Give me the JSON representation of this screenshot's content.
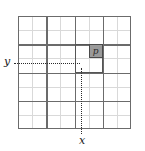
{
  "figure": {
    "type": "grid-diagram",
    "width": 145,
    "height": 151
  },
  "grid": {
    "columns": 8,
    "rows": 8,
    "block_size": 2,
    "left": 18,
    "top": 16,
    "width": 113,
    "height": 113,
    "cell_size": 14.125,
    "minor_line_color": "#d9d9d9",
    "major_line_color": "#6b6b6b",
    "minor_positions": [
      1,
      3,
      5,
      7
    ],
    "major_positions": [
      0,
      2,
      4,
      6,
      8
    ]
  },
  "highlight_block": {
    "label": "highlighted-block",
    "col": 4,
    "row": 2,
    "span_cols": 2,
    "span_rows": 2,
    "border_color": "#555555"
  },
  "shaded_cell": {
    "label": "p",
    "col": 5,
    "row": 2,
    "fill_color": "#9a9a9a",
    "border_color": "#4a4a4a"
  },
  "guides": {
    "horizontal": {
      "name": "y-guide",
      "from_x": 14,
      "to_x": 80,
      "y": 63,
      "style": "dotted",
      "color": "#2b2b2b"
    },
    "vertical": {
      "name": "x-guide",
      "x": 81,
      "from_y": 68,
      "to_y": 134,
      "style": "dotted",
      "color": "#2b2b2b"
    }
  },
  "axes": {
    "y_label": "y",
    "x_label": "x"
  },
  "chart_data": {
    "type": "heatmap",
    "title": "",
    "xlabel": "x",
    "ylabel": "y",
    "grid": true,
    "legend": "none",
    "categories_x": [
      0,
      1,
      2,
      3,
      4,
      5,
      6,
      7
    ],
    "categories_y": [
      0,
      1,
      2,
      3,
      4,
      5,
      6,
      7
    ],
    "highlighted_cells": [
      {
        "x": 5,
        "y": 2,
        "label": "p",
        "value": 1
      }
    ],
    "highlighted_regions": [
      {
        "x": 4,
        "y": 2,
        "width": 2,
        "height": 2,
        "label": "block"
      }
    ],
    "annotations": [
      {
        "text": "y",
        "position": "left",
        "points_to": {
          "x": 5,
          "y": 2
        }
      },
      {
        "text": "x",
        "position": "bottom",
        "points_to": {
          "x": 5,
          "y": 2
        }
      }
    ]
  }
}
